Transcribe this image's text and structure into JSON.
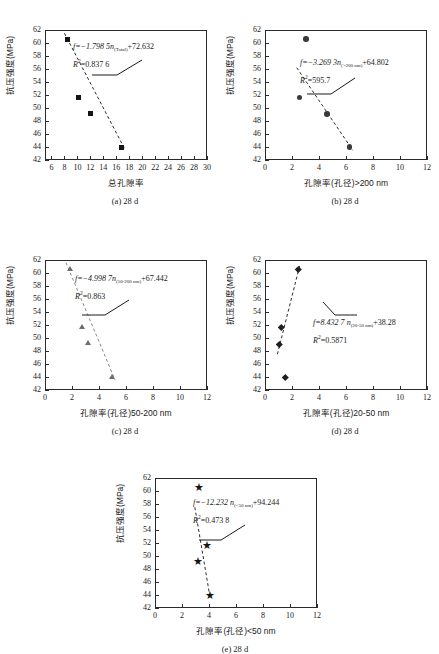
{
  "figure": {
    "y_axis_title": "抗压强度(MPa)",
    "y_ticks": [
      42,
      44,
      46,
      48,
      50,
      52,
      54,
      56,
      58,
      60,
      62
    ],
    "strength_values": [
      60.6,
      51.6,
      49.1,
      44.0
    ]
  },
  "chart_data": [
    {
      "type": "scatter",
      "panel": "a",
      "caption": "(a) 28 d",
      "xlabel": "总孔隙率",
      "ylabel": "抗压强度(MPa)",
      "xlim": [
        5,
        30
      ],
      "ylim": [
        42,
        62
      ],
      "xticks": [
        6,
        8,
        10,
        12,
        14,
        16,
        18,
        20,
        22,
        24,
        26,
        28,
        30
      ],
      "yticks": [
        42,
        44,
        46,
        48,
        50,
        52,
        54,
        56,
        58,
        60,
        62
      ],
      "marker": "square",
      "x": [
        8.4,
        10.1,
        12.0,
        16.8
      ],
      "values": [
        60.6,
        51.6,
        49.1,
        44.0
      ],
      "fit_line": {
        "x0": 8.0,
        "y0": 61.5,
        "x1": 17.4,
        "y1": 43.5
      },
      "equation": "f=−1.798 5n(Total)+72.632",
      "equation_parts": {
        "lead": "f=−1.798 5",
        "var": "n",
        "subscript": "(Total)",
        "tail": "+72.632"
      },
      "r_squared_label": "R²=0.837 6",
      "r_squared": "0.837 6",
      "grid": false,
      "legend": "none"
    },
    {
      "type": "scatter",
      "panel": "b",
      "caption": "(b) 28 d",
      "xlabel": "孔隙率(孔径)>200 nm",
      "ylabel": "抗压强度(MPa)",
      "xlim": [
        0,
        12
      ],
      "ylim": [
        42,
        62
      ],
      "xticks": [
        0,
        2,
        4,
        6,
        8,
        10,
        12
      ],
      "yticks": [
        42,
        44,
        46,
        48,
        50,
        52,
        54,
        56,
        58,
        60,
        62
      ],
      "marker": "circle",
      "x": [
        3.05,
        2.55,
        4.6,
        6.25
      ],
      "values": [
        60.6,
        51.6,
        49.1,
        44.0
      ],
      "fit_line": {
        "x0": 2.35,
        "y0": 56.2,
        "x1": 6.5,
        "y1": 43.5
      },
      "equation": "f=−3.269 3n(>200 nm)+64.802",
      "equation_parts": {
        "lead": "f=−3.269 3",
        "var": "n",
        "subscript": "(>200 nm)",
        "tail": "+64.802"
      },
      "r_squared_label": "R²=595.7",
      "r_squared": "595.7",
      "grid": false,
      "legend": "none"
    },
    {
      "type": "scatter",
      "panel": "c",
      "caption": "(c) 28 d",
      "xlabel": "孔隙率(孔径)50-200 nm",
      "ylabel": "抗压强度(MPa)",
      "xlim": [
        0,
        12
      ],
      "ylim": [
        42,
        62
      ],
      "xticks": [
        0,
        2,
        4,
        6,
        8,
        10,
        12
      ],
      "yticks": [
        42,
        44,
        46,
        48,
        50,
        52,
        54,
        56,
        58,
        60,
        62
      ],
      "marker": "triangle",
      "x": [
        1.85,
        2.75,
        3.2,
        5.0
      ],
      "values": [
        60.6,
        51.6,
        49.1,
        44.0
      ],
      "fit_line": {
        "x0": 1.55,
        "y0": 61.6,
        "x1": 5.2,
        "y1": 43.5
      },
      "equation": "f=−4.998 7n(50-200 nm)+67.442",
      "equation_parts": {
        "lead": "f=−4.998 7",
        "var": "n",
        "subscript": "(50-200 nm)",
        "tail": "+67.442"
      },
      "r_squared_label": "R²=0.863",
      "r_squared": "0.863",
      "grid": false,
      "legend": "none"
    },
    {
      "type": "scatter",
      "panel": "d",
      "caption": "(d) 28 d",
      "xlabel": "孔隙率(孔径)20-50 nm",
      "ylabel": "抗压强度(MPa)",
      "xlim": [
        0,
        12
      ],
      "ylim": [
        42,
        62
      ],
      "xticks": [
        0,
        2,
        4,
        6,
        8,
        10,
        12
      ],
      "yticks": [
        42,
        44,
        46,
        48,
        50,
        52,
        54,
        56,
        58,
        60,
        62
      ],
      "marker": "diamond",
      "x": [
        2.45,
        1.2,
        1.05,
        1.5
      ],
      "values": [
        60.6,
        51.6,
        49.1,
        44.0
      ],
      "fit_line": {
        "x0": 0.92,
        "y0": 47.5,
        "x1": 2.6,
        "y1": 61.4
      },
      "equation": "f=8.432 7 n(20-50 nm)+38.28",
      "equation_parts": {
        "lead": "f=8.432 7 ",
        "var": "n",
        "subscript": "(20-50 nm)",
        "tail": "+38.28"
      },
      "r_squared_label": "R²=0.5871",
      "r_squared": "0.5871",
      "grid": false,
      "legend": "none"
    },
    {
      "type": "scatter",
      "panel": "e",
      "caption": "(e) 28 d",
      "xlabel": "孔隙率(孔径)<50 nm",
      "ylabel": "抗压强度(MPa)",
      "xlim": [
        0,
        12
      ],
      "ylim": [
        42,
        62
      ],
      "xticks": [
        0,
        2,
        4,
        6,
        8,
        10,
        12
      ],
      "yticks": [
        42,
        44,
        46,
        48,
        50,
        52,
        54,
        56,
        58,
        60,
        62
      ],
      "marker": "star",
      "x": [
        3.15,
        3.75,
        3.1,
        4.0
      ],
      "values": [
        60.6,
        51.6,
        49.1,
        44.0
      ],
      "fit_line": {
        "x0": 2.95,
        "y0": 57.5,
        "x1": 4.08,
        "y1": 43.6
      },
      "equation": "f=−12.232 n(<50 nm)+94.244",
      "equation_parts": {
        "lead": "f=−12.232 ",
        "var": "n",
        "subscript": "(<50 nm)",
        "tail": "+94.244"
      },
      "r_squared_label": "R²=0.473 8",
      "r_squared": "0.473 8",
      "grid": false,
      "legend": "none"
    }
  ]
}
